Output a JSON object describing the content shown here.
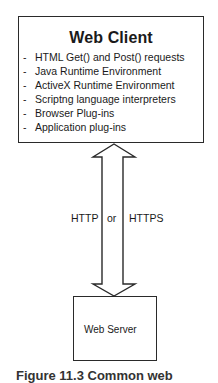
{
  "client": {
    "title": "Web Client",
    "items": [
      {
        "bullet": "-",
        "text": "HTML Get() and Post() requests"
      },
      {
        "bullet": "-",
        "text": "Java Runtime Environment"
      },
      {
        "bullet": "-",
        "text": "ActiveX Runtime Environment"
      },
      {
        "bullet": "-",
        "text": "Scriptng language interpreters"
      },
      {
        "bullet": "-",
        "text": "Browser Plug-ins"
      },
      {
        "bullet": "-",
        "text": "Application plug-ins"
      }
    ]
  },
  "connection": {
    "left_label": "HTTP",
    "middle_label": "or",
    "right_label": "HTTPS",
    "arrow": "double-headed-vertical-arrow"
  },
  "server": {
    "label": "Web Server"
  },
  "caption": {
    "text": "Figure 11.3  Common web"
  },
  "colors": {
    "stroke": "#2a2a2a",
    "text": "#1a1a1a",
    "background": "#ffffff"
  }
}
